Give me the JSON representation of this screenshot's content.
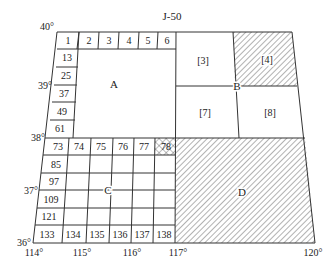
{
  "title": "J-50",
  "latitude_labels": [
    "40°",
    "39°",
    "38°",
    "37°",
    "36°"
  ],
  "longitude_labels": [
    "114°",
    "115°",
    "116°",
    "117°",
    "120°"
  ],
  "top_row_cells": [
    "1",
    "2",
    "3",
    "4",
    "5",
    "6"
  ],
  "left_column_cells": [
    "13",
    "25",
    "37",
    "49",
    "61"
  ],
  "c_top_row_cells": [
    "73",
    "74",
    "75",
    "76",
    "77",
    "78"
  ],
  "c_left_column_cells": [
    "85",
    "97",
    "109",
    "121"
  ],
  "c_bottom_row_cells": [
    "133",
    "134",
    "135",
    "136",
    "137",
    "138"
  ],
  "regions": {
    "A": "A",
    "B": "B",
    "C": "C",
    "D": "D"
  },
  "b_subregions": [
    "[3]",
    "[4]",
    "[7]",
    "[8]"
  ],
  "colors": {
    "line": "#333333",
    "hatch": "#555555",
    "background": "#ffffff"
  }
}
